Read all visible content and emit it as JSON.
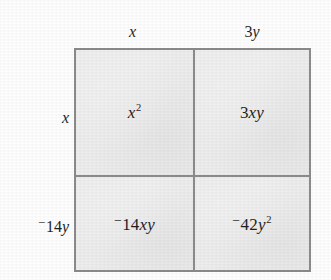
{
  "figure": {
    "type": "area-model-grid",
    "colors": {
      "cell_fill": "#eeeeee",
      "border": "#8c8c8c",
      "text": "#1f1f1f",
      "page_background": "#ffffff"
    }
  },
  "column_headers": [
    {
      "id": "col-x",
      "text": "x",
      "parts": [
        {
          "t": "x",
          "style": "var"
        }
      ]
    },
    {
      "id": "col-3y",
      "text": "3y",
      "parts": [
        {
          "t": "3",
          "style": "num"
        },
        {
          "t": "y",
          "style": "var"
        }
      ]
    }
  ],
  "row_headers": [
    {
      "id": "row-x",
      "text": "x",
      "parts": [
        {
          "t": "x",
          "style": "var"
        }
      ]
    },
    {
      "id": "row-14y",
      "text": "⁻14y",
      "parts": [
        {
          "t": "−",
          "style": "neg"
        },
        {
          "t": "14",
          "style": "num"
        },
        {
          "t": "y",
          "style": "var"
        }
      ]
    }
  ],
  "cells": [
    {
      "id": "cell-r0c0",
      "row": 0,
      "col": 0,
      "text": "x²",
      "parts": [
        {
          "t": "x",
          "style": "var"
        },
        {
          "t": "2",
          "style": "exp"
        }
      ]
    },
    {
      "id": "cell-r0c1",
      "row": 0,
      "col": 1,
      "text": "3xy",
      "parts": [
        {
          "t": "3",
          "style": "num"
        },
        {
          "t": "xy",
          "style": "var"
        }
      ]
    },
    {
      "id": "cell-r1c0",
      "row": 1,
      "col": 0,
      "text": "⁻14xy",
      "parts": [
        {
          "t": "−",
          "style": "neg"
        },
        {
          "t": "14",
          "style": "num"
        },
        {
          "t": "xy",
          "style": "var"
        }
      ]
    },
    {
      "id": "cell-r1c1",
      "row": 1,
      "col": 1,
      "text": "⁻42y²",
      "parts": [
        {
          "t": "−",
          "style": "neg"
        },
        {
          "t": "42",
          "style": "num"
        },
        {
          "t": "y",
          "style": "var"
        },
        {
          "t": "2",
          "style": "exp"
        }
      ]
    }
  ]
}
